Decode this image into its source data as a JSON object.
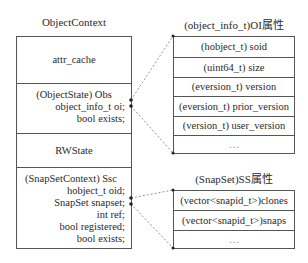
{
  "left_struct": {
    "title": "ObjectContext",
    "sections": [
      {
        "name": "attr_cache",
        "label": "attr_cache"
      },
      {
        "name": "obs",
        "header": "(ObjectState) Obs",
        "fields": [
          "object_info_t oi;",
          "bool exists;"
        ]
      },
      {
        "name": "rwstate",
        "label": "RWState"
      },
      {
        "name": "ssc",
        "header": "(SnapSetContext) Ssc",
        "fields": [
          "hobject_t oid;",
          "SnapSet snapset;",
          "int ref;",
          "bool registered;",
          "bool exists;"
        ]
      }
    ]
  },
  "oi_struct": {
    "title": "(object_info_t)OI属性",
    "rows": [
      "(hobject_t) soid",
      "(uint64_t) size",
      "(eversion_t) version",
      "(eversion_t) prior_version",
      "(version_t) user_version",
      "…"
    ]
  },
  "ss_struct": {
    "title": "(SnapSet)SS属性",
    "rows": [
      "(vector<snapid_t>)clones",
      "(vector<snapid_t>)snaps",
      "…"
    ]
  },
  "colors": {
    "line": "#555555",
    "dash": "#777777",
    "text": "#2a2a2a"
  }
}
